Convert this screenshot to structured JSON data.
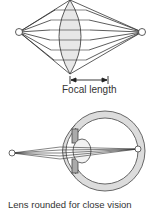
{
  "top_diagram": {
    "label": "Focal length",
    "colors": {
      "lens_fill": "#e8e8e8",
      "stroke": "#333333"
    }
  },
  "bottom_diagram": {
    "caption": "Lens rounded for close vision",
    "colors": {
      "eye_fill": "#dcdcdc",
      "stroke": "#444444"
    }
  }
}
